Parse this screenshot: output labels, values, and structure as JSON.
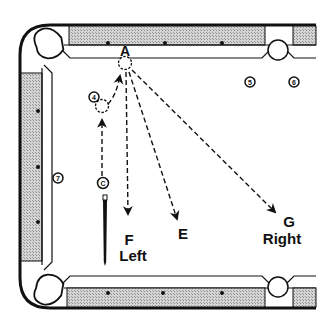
{
  "diagram": {
    "type": "billiards-table-shot-diagram",
    "colors": {
      "background": "#ffffff",
      "ink": "#111111",
      "rail_fill": "#c8c8c8"
    },
    "labels": {
      "target_point": "A",
      "path_f": "F",
      "path_f_side": "Left",
      "path_e": "E",
      "path_g": "G",
      "path_g_side": "Right"
    },
    "balls": [
      {
        "id": "ball-4",
        "number": "4"
      },
      {
        "id": "ball-5",
        "number": "5"
      },
      {
        "id": "ball-6",
        "number": "6"
      },
      {
        "id": "ball-7",
        "number": "7"
      },
      {
        "id": "cue-ball",
        "number": "C"
      }
    ],
    "rail_diamonds": {
      "top": 3,
      "bottom": 3,
      "left": 3
    }
  }
}
